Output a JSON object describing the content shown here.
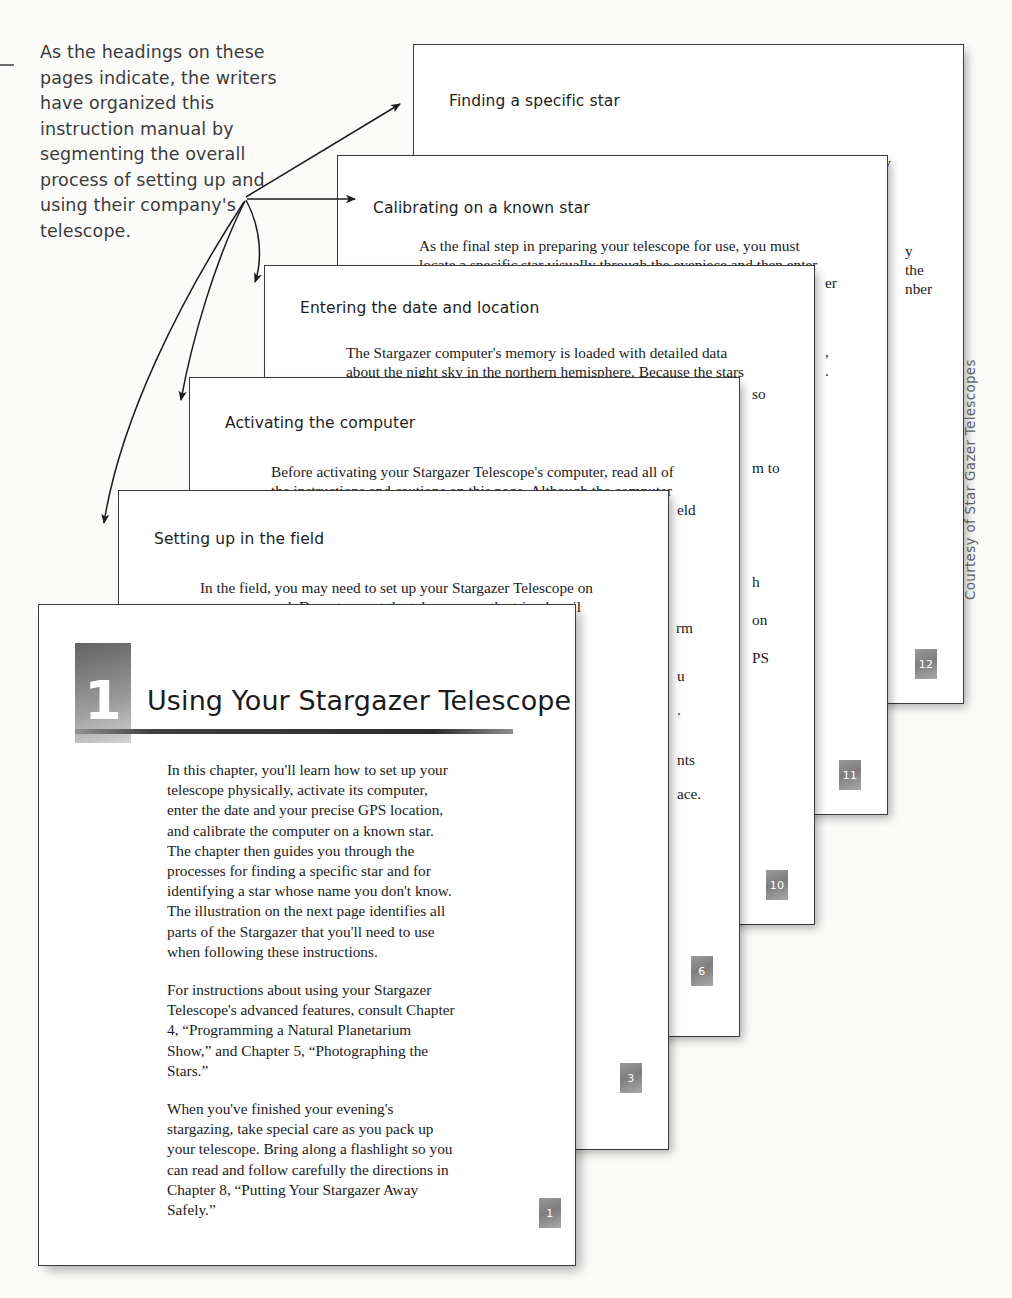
{
  "caption": {
    "text": "As the headings on these pages indicate, the writers have organized this instruction manual by segmenting the overall process of setting up and using their company's telescope."
  },
  "credit": {
    "text": "Courtesy of Star Gazer Telescopes"
  },
  "pages": [
    {
      "heading": "Finding a specific star",
      "body_line1": "When looking for a specific star, remember that a star's visibility",
      "body_line2": "depends on the darkness of the sky. At dusk, only the brightest",
      "page_number": "12"
    },
    {
      "heading": "Calibrating on a known star",
      "body_line1": "As the final step in preparing your telescope for use, you must",
      "body_line2": "locate a specific star visually through the eyepiece and then enter",
      "page_number": "11"
    },
    {
      "heading": "Entering the date and location",
      "body_line1": "The Stargazer computer's memory is loaded with detailed data",
      "body_line2": "about the night sky in the northern hemisphere. Because the stars",
      "page_number": "10"
    },
    {
      "heading": "Activating the computer",
      "body_line1": "Before activating your Stargazer Telescope's computer, read all of",
      "body_line2": "the instructions and cautions on this page. Although the computer",
      "page_number": "6"
    },
    {
      "heading": "Setting up in the field",
      "body_line1": "In the field, you may need to set up your Stargazer Telescope on",
      "body_line2": "uneven ground. Do not mount the telescope on the tripod until",
      "page_number": "3"
    }
  ],
  "fragments": {
    "f_y": "y",
    "f_the": "the",
    "f_nber": "nber",
    "f_comma": ",",
    "f_period": ".",
    "f_so": "so",
    "f_mto": "m to",
    "f_eld": "eld",
    "f_h": "h",
    "f_on": "on",
    "f_ps": "PS",
    "f_u": "u",
    "f_dot": ".",
    "f_nts": "nts",
    "f_ace": "ace.",
    "f_er": "er"
  },
  "chapter": {
    "number": "1",
    "title": "Using Your Stargazer Telescope",
    "page_number": "1",
    "paragraphs": [
      "In this chapter, you'll learn how to set up your telescope physically, activate its computer, enter the date and your precise GPS location, and calibrate the computer on a known star. The chapter then guides you through the processes for finding a specific star and for identifying a star whose name you don't know. The illustration on the next page identifies all parts of the Stargazer that you'll need to use when following these instructions.",
      "For instructions about using your Stargazer Telescope's advanced features, consult Chapter 4, “Programming a Natural Planetarium Show,” and Chapter 5, “Photographing the Stars.”",
      "When you've finished your evening's stargazing, take special care as you pack up your telescope. Bring along a flashlight so you can read and follow carefully the directions in Chapter 8, “Putting Your Stargazer Away Safely.”"
    ]
  },
  "colors": {
    "sheet_border": "#3a3a3a",
    "text": "#1b1b1b",
    "caption_text": "#3b3b3b",
    "chip_gray": "#8c8c8c",
    "credit_text": "#5e5e5e"
  }
}
